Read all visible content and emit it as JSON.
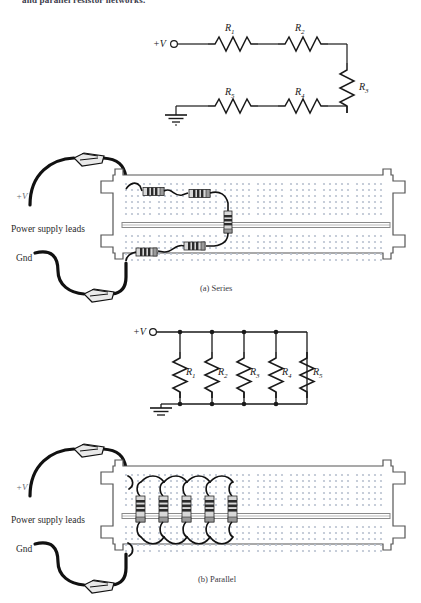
{
  "page": {
    "truncated_top_text": "and parallel resistor networks.",
    "background": "#ffffff"
  },
  "figures": [
    {
      "id": "series",
      "caption": "(a) Series",
      "schematic": {
        "type": "series-resistor-network",
        "source_label": "+V",
        "ground_label": "gnd-symbol",
        "resistors": [
          {
            "label": "R",
            "sub": "1",
            "orientation": "horizontal"
          },
          {
            "label": "R",
            "sub": "2",
            "orientation": "horizontal"
          },
          {
            "label": "R",
            "sub": "3",
            "orientation": "vertical"
          },
          {
            "label": "R",
            "sub": "4",
            "orientation": "horizontal"
          },
          {
            "label": "R",
            "sub": "5",
            "orientation": "horizontal"
          }
        ]
      },
      "breadboard": {
        "lead_labels": {
          "positive": "+V",
          "middle": "Power supply leads",
          "ground": "Gnd"
        },
        "component_count": 5,
        "layout": "daisy-chained resistors with jumper wires"
      }
    },
    {
      "id": "parallel",
      "caption": "(b) Parallel",
      "schematic": {
        "type": "parallel-resistor-network",
        "source_label": "+V",
        "ground_label": "gnd-symbol",
        "resistors": [
          {
            "label": "R",
            "sub": "1",
            "orientation": "vertical"
          },
          {
            "label": "R",
            "sub": "2",
            "orientation": "vertical"
          },
          {
            "label": "R",
            "sub": "3",
            "orientation": "vertical"
          },
          {
            "label": "R",
            "sub": "4",
            "orientation": "vertical"
          },
          {
            "label": "R",
            "sub": "5",
            "orientation": "vertical"
          }
        ]
      },
      "breadboard": {
        "lead_labels": {
          "positive": "+V",
          "middle": "Power supply leads",
          "ground": "Gnd"
        },
        "component_count": 5,
        "layout": "resistors straddling center channel in parallel"
      }
    }
  ],
  "colors": {
    "wire": "#1a1a1a",
    "board_outline": "#555555",
    "board_fill": "#ffffff",
    "hole": "#b9c2d0",
    "channel": "#888888",
    "resistor_body": "#d8d8d8",
    "resistor_band": "#2b2b2b",
    "resistor_cap": "#9a9a9a",
    "label_text": "#2a2a2a",
    "muted_text": "#6a6a72"
  }
}
